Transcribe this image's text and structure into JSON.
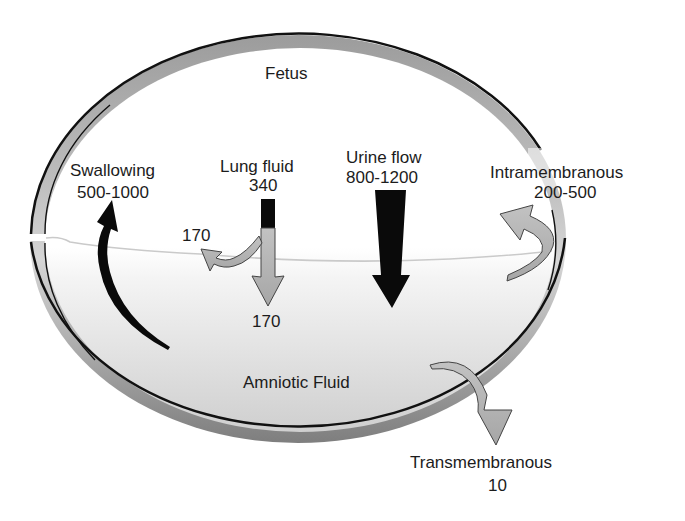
{
  "diagram": {
    "regions": {
      "fetus": "Fetus",
      "amniotic_fluid": "Amniotic Fluid"
    },
    "flows": {
      "swallowing": {
        "label": "Swallowing",
        "value": "500-1000",
        "direction": "amniotic fluid to fetus"
      },
      "lung_fluid": {
        "label": "Lung fluid",
        "value": "340",
        "split_swallowed": "170",
        "split_to_fluid": "170",
        "direction": "fetus to amniotic fluid"
      },
      "urine_flow": {
        "label": "Urine flow",
        "value": "800-1200",
        "direction": "fetus to amniotic fluid"
      },
      "intramembranous": {
        "label": "Intramembranous",
        "value": "200-500",
        "direction": "amniotic fluid to fetal circulation"
      },
      "transmembranous": {
        "label": "Transmembranous",
        "value": "10",
        "direction": "amniotic fluid out through membrane"
      }
    },
    "colors": {
      "outline": "#111111",
      "membrane_band": "#9a9a9a",
      "fluid_top": "#ffffff",
      "fluid_bottom": "#d2d2d2",
      "dark_arrow": "#0a0a0a",
      "light_arrow": "#b4b4b4",
      "divider_line": "#c8c8c8"
    }
  }
}
